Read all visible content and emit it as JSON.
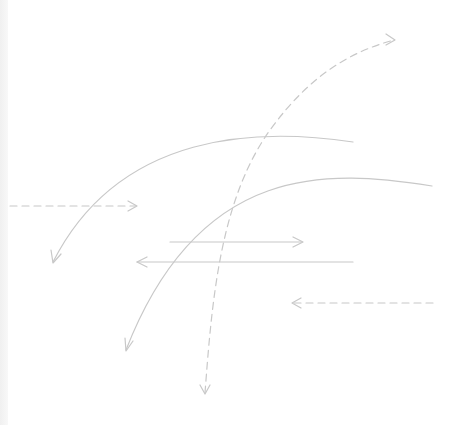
{
  "canvas": {
    "width": 460,
    "height": 425,
    "background": "#ffffff",
    "stroke_color": "#c8c8c8",
    "left_strip_color": "#f0f0f0"
  },
  "arrows": [
    {
      "id": "dashed-curve-vertical",
      "style": "dashed",
      "shape": "curve",
      "path": "M205,393 C212,300 220,200 270,130 C310,75 350,52 394,40",
      "heads": [
        "end",
        "start"
      ]
    },
    {
      "id": "solid-curve-upper",
      "style": "solid",
      "shape": "curve",
      "path": "M353,142 C260,128 120,130 53,262",
      "heads": [
        "end"
      ]
    },
    {
      "id": "solid-curve-lower",
      "style": "solid",
      "shape": "curve",
      "path": "M432,186 C330,170 200,160 126,350",
      "heads": [
        "end"
      ]
    },
    {
      "id": "dashed-horizontal-right",
      "style": "dashed",
      "shape": "line",
      "path": "M10,206 L136,206",
      "heads": [
        "end"
      ]
    },
    {
      "id": "solid-horizontal-right",
      "style": "solid",
      "shape": "line",
      "path": "M170,242 L302,242",
      "heads": [
        "end"
      ]
    },
    {
      "id": "solid-horizontal-left",
      "style": "solid",
      "shape": "line",
      "path": "M353,262 L137,262",
      "heads": [
        "end"
      ]
    },
    {
      "id": "dashed-horizontal-left",
      "style": "dashed",
      "shape": "line",
      "path": "M433,303 L292,303",
      "heads": [
        "end"
      ]
    }
  ]
}
